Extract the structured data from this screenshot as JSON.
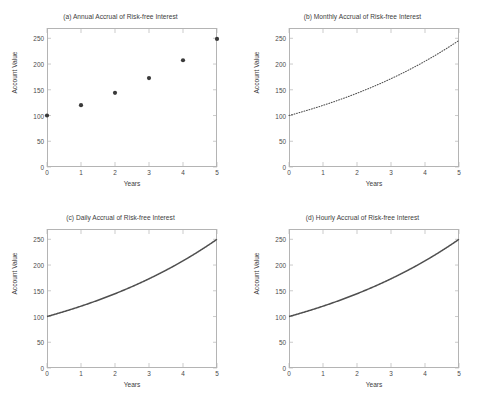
{
  "figure": {
    "background": "#ffffff",
    "axis_color": "#b4b4b4",
    "text_color": "#4a4a4a",
    "line_color": "#4f4f4f",
    "marker_color": "#3a3a3a"
  },
  "chart_data": [
    {
      "type": "scatter",
      "panel": "a",
      "title": "(a) Annual Accrual of Risk-free Interest",
      "xlabel": "Years",
      "ylabel": "Account Value",
      "xlim": [
        0,
        5
      ],
      "ylim": [
        0,
        270
      ],
      "xticks": [
        0,
        1,
        2,
        3,
        4,
        5
      ],
      "xticklabels": [
        "0",
        "1",
        "2",
        "3",
        "4",
        "5"
      ],
      "yticks": [
        0,
        50,
        100,
        150,
        200,
        250
      ],
      "yticklabels": [
        "0",
        "50",
        "100",
        "150",
        "200",
        "250"
      ],
      "grid": false,
      "legend": "none",
      "marker": "filled-circle",
      "x": [
        0,
        1,
        2,
        3,
        4,
        5
      ],
      "values": [
        100,
        120,
        144,
        172.8,
        207.4,
        248.8
      ]
    },
    {
      "type": "line",
      "panel": "b",
      "title": "(b) Monthly Accrual of Risk-free Interest",
      "xlabel": "Years",
      "ylabel": "Account Value",
      "xlim": [
        0,
        5
      ],
      "ylim": [
        0,
        270
      ],
      "xticks": [
        0,
        1,
        2,
        3,
        4,
        5
      ],
      "xticklabels": [
        "0",
        "1",
        "2",
        "3",
        "4",
        "5"
      ],
      "yticks": [
        0,
        50,
        100,
        150,
        200,
        250
      ],
      "yticklabels": [
        "0",
        "50",
        "100",
        "150",
        "200",
        "250"
      ],
      "grid": false,
      "legend": "none",
      "linestyle": "dotted",
      "x": [
        0,
        0.25,
        0.5,
        0.75,
        1,
        1.25,
        1.5,
        1.75,
        2,
        2.25,
        2.5,
        2.75,
        3,
        3.25,
        3.5,
        3.75,
        4,
        4.25,
        4.5,
        4.75,
        5
      ],
      "values": [
        100,
        104.6,
        109.4,
        114.4,
        119.7,
        125.2,
        131,
        137,
        143.3,
        149.9,
        156.8,
        164,
        171.6,
        179.5,
        187.7,
        196.4,
        205.4,
        214.9,
        224.8,
        235.1,
        245.9
      ]
    },
    {
      "type": "line",
      "panel": "c",
      "title": "(c) Daily Accrual of Risk-free Interest",
      "xlabel": "Years",
      "ylabel": "Account Value",
      "xlim": [
        0,
        5
      ],
      "ylim": [
        0,
        270
      ],
      "xticks": [
        0,
        1,
        2,
        3,
        4,
        5
      ],
      "xticklabels": [
        "0",
        "1",
        "2",
        "3",
        "4",
        "5"
      ],
      "yticks": [
        0,
        50,
        100,
        150,
        200,
        250
      ],
      "yticklabels": [
        "0",
        "50",
        "100",
        "150",
        "200",
        "250"
      ],
      "grid": false,
      "legend": "none",
      "linestyle": "solid",
      "x": [
        0,
        0.25,
        0.5,
        0.75,
        1,
        1.25,
        1.5,
        1.75,
        2,
        2.25,
        2.5,
        2.75,
        3,
        3.25,
        3.5,
        3.75,
        4,
        4.25,
        4.5,
        4.75,
        5
      ],
      "values": [
        100,
        104.7,
        109.6,
        114.7,
        120.1,
        125.7,
        131.6,
        137.8,
        144.2,
        151,
        158.1,
        165.5,
        173.3,
        181.4,
        189.9,
        198.8,
        208.1,
        217.9,
        228.1,
        238.8,
        250
      ]
    },
    {
      "type": "line",
      "panel": "d",
      "title": "(d) Hourly Accrual of Risk-free Interest",
      "xlabel": "Years",
      "ylabel": "Account Value",
      "xlim": [
        0,
        5
      ],
      "ylim": [
        0,
        270
      ],
      "xticks": [
        0,
        1,
        2,
        3,
        4,
        5
      ],
      "xticklabels": [
        "0",
        "1",
        "2",
        "3",
        "4",
        "5"
      ],
      "yticks": [
        0,
        50,
        100,
        150,
        200,
        250
      ],
      "yticklabels": [
        "0",
        "50",
        "100",
        "150",
        "200",
        "250"
      ],
      "grid": false,
      "legend": "none",
      "linestyle": "solid",
      "x": [
        0,
        0.25,
        0.5,
        0.75,
        1,
        1.25,
        1.5,
        1.75,
        2,
        2.25,
        2.5,
        2.75,
        3,
        3.25,
        3.5,
        3.75,
        4,
        4.25,
        4.5,
        4.75,
        5
      ],
      "values": [
        100,
        104.7,
        109.6,
        114.7,
        120.1,
        125.7,
        131.6,
        137.8,
        144.2,
        151,
        158.1,
        165.5,
        173.3,
        181.4,
        189.9,
        198.8,
        208.1,
        217.9,
        228.1,
        238.8,
        250
      ]
    }
  ]
}
